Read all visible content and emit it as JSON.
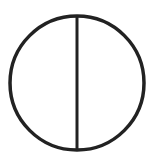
{
  "figure": {
    "icon": "circle-with-vertical-diameter-icon",
    "stroke_color": "#222222",
    "background": "#ffffff",
    "circle": {
      "cx": 77,
      "cy": 83,
      "r": 67,
      "stroke_width": 3.5
    },
    "line": {
      "x1": 77,
      "y1": 16,
      "x2": 77,
      "y2": 150,
      "stroke_width": 3
    }
  }
}
